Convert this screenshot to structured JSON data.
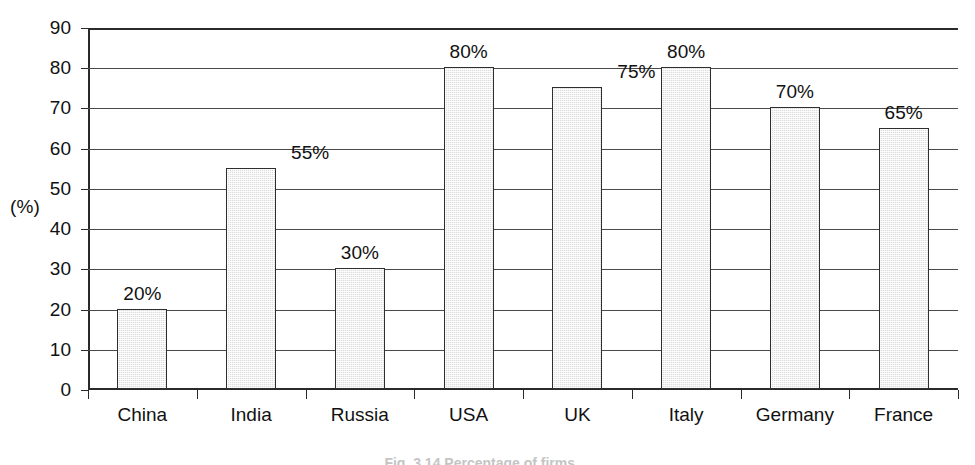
{
  "chart_data": {
    "type": "bar",
    "title": "",
    "xlabel": "",
    "ylabel": "(%)",
    "ylim": [
      0,
      90
    ],
    "ytick_step": 10,
    "yticks": [
      90,
      80,
      70,
      60,
      50,
      40,
      30,
      20,
      10,
      0
    ],
    "ytick_labels": [
      "90",
      "80",
      "70",
      "60",
      "50",
      "40",
      "30",
      "20",
      "10",
      "0"
    ],
    "grid": true,
    "legend": false,
    "categories": [
      "China",
      "India",
      "Russia",
      "USA",
      "UK",
      "Italy",
      "Germany",
      "France"
    ],
    "values": [
      20,
      55,
      30,
      80,
      75,
      80,
      70,
      65
    ],
    "data_labels": [
      "20%",
      "55%",
      "30%",
      "80%",
      "75%",
      "80%",
      "70%",
      "65%"
    ],
    "label_alignment": [
      "center",
      "right",
      "center",
      "center",
      "right",
      "center",
      "center",
      "center"
    ],
    "bar_fill_color": "#dcdcdc",
    "bar_border_color": "#2e2e2e",
    "axis_color": "#2a2a2a",
    "grid_color": "#4a4a4a",
    "background_color": "#ffffff"
  },
  "axis": {
    "unit_label": "(%)"
  },
  "caption": {
    "text": "Fig. 3.14   Percentage of firms ..."
  }
}
